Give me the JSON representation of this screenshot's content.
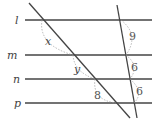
{
  "diagram": {
    "lines": [
      {
        "name": "l",
        "y": 20
      },
      {
        "name": "m",
        "y": 55
      },
      {
        "name": "n",
        "y": 79
      },
      {
        "name": "p",
        "y": 103
      }
    ],
    "left_segments": {
      "x": "x",
      "y": "y",
      "p_seg": "8"
    },
    "right_segments": {
      "a": "9",
      "b": "6",
      "c": "6"
    }
  }
}
